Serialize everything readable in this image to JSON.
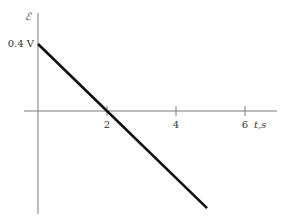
{
  "chart_data": {
    "type": "line",
    "title": "",
    "xlabel": "t,s",
    "ylabel": "ℰ",
    "xlim": [
      0,
      7
    ],
    "ylim": [
      -0.6,
      0.6
    ],
    "x_ticks": [
      2,
      4,
      6
    ],
    "x_tick_labels": [
      "2",
      "4",
      "6"
    ],
    "y_tick_values": [
      0.4
    ],
    "y_tick_labels": [
      "0.4 V"
    ],
    "grid": false,
    "legend": null,
    "series": [
      {
        "name": "emf",
        "x": [
          0,
          2,
          4.9
        ],
        "y": [
          0.4,
          0.0,
          -0.58
        ]
      }
    ]
  }
}
